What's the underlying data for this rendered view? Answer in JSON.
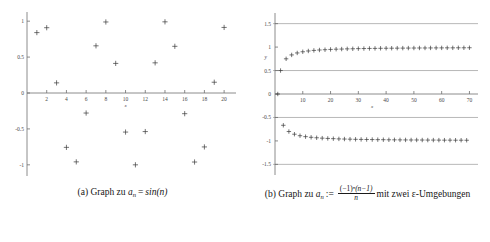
{
  "figure": {
    "panels": [
      {
        "id": "panel-a",
        "caption_label": "(a)",
        "caption_text": "Graph zu",
        "caption_var": "a",
        "caption_var_sub": "n",
        "caption_rel": "=",
        "caption_expr": "sin(n)"
      },
      {
        "id": "panel-b",
        "caption_label": "(b)",
        "caption_text": "Graph zu",
        "caption_var": "a",
        "caption_var_sub": "n",
        "caption_rel": ":=",
        "caption_num_base": "(−1)",
        "caption_num_exp": "n",
        "caption_num_rest": "(n−1)",
        "caption_den": "n",
        "caption_tail": "mit zwei ε-Umgebungen"
      }
    ]
  },
  "chart_data": [
    {
      "type": "scatter",
      "title": "",
      "xlabel": "x",
      "ylabel": "",
      "xlim": [
        0,
        20.8
      ],
      "ylim": [
        -1.1,
        1.1
      ],
      "xticks": [
        2,
        4,
        6,
        8,
        10,
        12,
        14,
        16,
        18,
        20
      ],
      "yticks": [
        1,
        0.5,
        0,
        -0.5,
        -1
      ],
      "ytick_labels": [
        "1",
        "0.5",
        "0",
        "-0.5",
        "-1"
      ],
      "grid": false,
      "legend": "none",
      "marker": "plus",
      "series": [
        {
          "name": "a_n = sin(n)",
          "x": [
            1,
            2,
            3,
            4,
            5,
            6,
            7,
            8,
            9,
            10,
            11,
            12,
            13,
            14,
            15,
            16,
            17,
            18,
            19,
            20
          ],
          "values": [
            0.841,
            0.909,
            0.141,
            -0.757,
            -0.959,
            -0.279,
            0.657,
            0.989,
            0.412,
            -0.544,
            -1.0,
            -0.537,
            0.42,
            0.991,
            0.65,
            -0.288,
            -0.961,
            -0.751,
            0.15,
            0.913
          ]
        }
      ]
    },
    {
      "type": "scatter",
      "title": "",
      "xlabel": "x",
      "ylabel": "y",
      "xlim": [
        0,
        72
      ],
      "ylim": [
        -1.62,
        1.62
      ],
      "xticks": [
        10,
        20,
        30,
        40,
        50,
        60,
        70
      ],
      "yticks": [
        1.5,
        1,
        0.5,
        0,
        -0.5,
        -1,
        -1.5
      ],
      "ytick_labels": [
        "1.5",
        "1",
        "0.5",
        "0",
        "-0.5",
        "-1",
        "-1.5"
      ],
      "grid": false,
      "legend": "none",
      "marker": "plus",
      "epsilon_lines": [
        1.5,
        0.5,
        -0.5,
        -1.5
      ],
      "epsilon_line_color": "#9a9a9a",
      "axis_color": "#6f6f6f",
      "marker_color": "#3a3a3a",
      "series": [
        {
          "name": "a_n = (-1)^n (n-1)/n",
          "x": [
            1,
            2,
            3,
            4,
            5,
            6,
            7,
            8,
            9,
            10,
            11,
            12,
            13,
            14,
            15,
            16,
            17,
            18,
            19,
            20,
            21,
            22,
            23,
            24,
            25,
            26,
            27,
            28,
            29,
            30,
            31,
            32,
            33,
            34,
            35,
            36,
            37,
            38,
            39,
            40,
            41,
            42,
            43,
            44,
            45,
            46,
            47,
            48,
            49,
            50,
            51,
            52,
            53,
            54,
            55,
            56,
            57,
            58,
            59,
            60,
            61,
            62,
            63,
            64,
            65,
            66,
            67,
            68,
            69,
            70
          ],
          "values": [
            0.0,
            0.5,
            -0.667,
            0.75,
            -0.8,
            0.833,
            -0.857,
            0.875,
            -0.889,
            0.9,
            -0.909,
            0.917,
            -0.923,
            0.929,
            -0.933,
            0.938,
            -0.941,
            0.944,
            -0.947,
            0.95,
            -0.952,
            0.955,
            -0.957,
            0.958,
            -0.96,
            0.962,
            -0.963,
            0.964,
            -0.966,
            0.967,
            -0.968,
            0.969,
            -0.97,
            0.971,
            -0.971,
            0.972,
            -0.973,
            0.974,
            -0.974,
            0.975,
            -0.976,
            0.976,
            -0.977,
            0.977,
            -0.978,
            0.978,
            -0.979,
            0.979,
            -0.98,
            0.98,
            -0.98,
            0.981,
            -0.981,
            0.981,
            -0.982,
            0.982,
            -0.982,
            0.983,
            -0.983,
            0.983,
            -0.984,
            0.984,
            -0.984,
            0.984,
            -0.985,
            0.985,
            -0.985,
            0.985,
            -0.986,
            0.986
          ]
        }
      ]
    }
  ]
}
